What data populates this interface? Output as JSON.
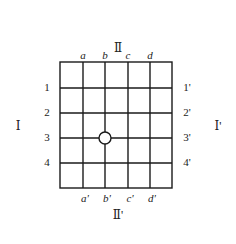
{
  "diagram": {
    "side_labels": {
      "top": "Ⅱ",
      "bottom": "Ⅱ'",
      "left": "Ⅰ",
      "right": "Ⅰ'"
    },
    "column_labels_top": [
      "a",
      "b",
      "c",
      "d"
    ],
    "column_labels_bottom": [
      "a'",
      "b'",
      "c'",
      "d'"
    ],
    "row_labels_left": [
      "1",
      "2",
      "3",
      "4"
    ],
    "row_labels_right": [
      "1'",
      "2'",
      "3'",
      "4'"
    ],
    "grid": {
      "rows": 5,
      "cols": 5
    },
    "marker": {
      "shape": "circle",
      "at_column": "b",
      "at_row": "3"
    },
    "line_color": "#1a1a1a"
  }
}
